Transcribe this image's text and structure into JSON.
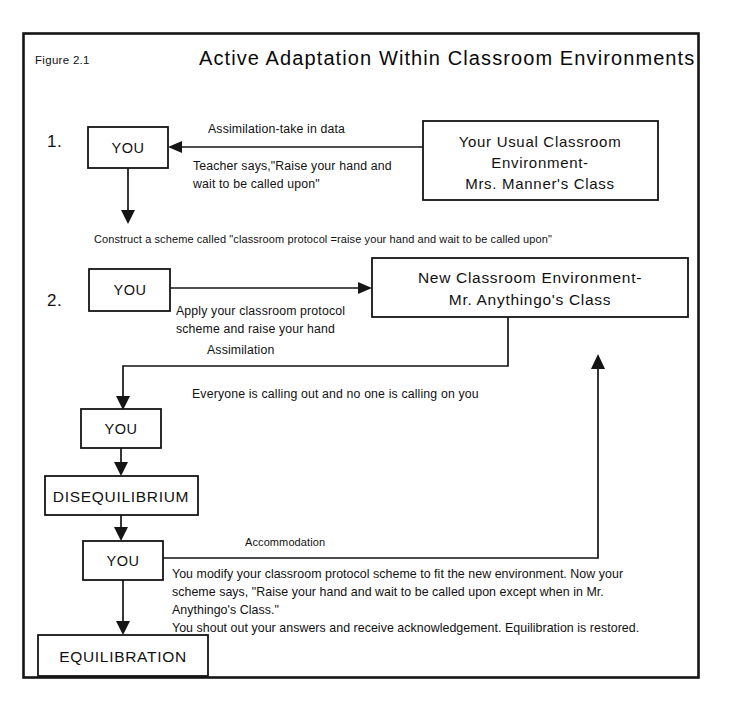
{
  "figure": {
    "label": "Figure 2.1",
    "title": "Active Adaptation Within Classroom Environments"
  },
  "steps": {
    "one": "1.",
    "two": "2."
  },
  "boxes": {
    "you_1": "YOU",
    "you_2": "YOU",
    "you_3": "YOU",
    "you_4": "YOU",
    "usual_env_line1": "Your Usual Classroom",
    "usual_env_line2": "Environment-",
    "usual_env_line3": "Mrs.  Manner's Class",
    "new_env_line1": "New Classroom Environment-",
    "new_env_line2": "Mr. Anythingo's Class",
    "disequilibrium": "DISEQUILIBRIUM",
    "equilibration": "EQUILIBRATION"
  },
  "labels": {
    "assimilation_take_in_data": "Assimilation-take in data",
    "teacher_says_line1": "Teacher says,\"Raise your hand and",
    "teacher_says_line2": "wait to be called upon\"",
    "construct_scheme": "Construct a scheme called \"classroom protocol =raise your hand and wait to be called upon\"",
    "apply_scheme_line1": "Apply your classroom protocol",
    "apply_scheme_line2": "scheme and raise your hand",
    "assimilation": "Assimilation",
    "everyone_calling_out": "Everyone is calling out and no one is calling on you",
    "accommodation": "Accommodation"
  },
  "paragraph": {
    "line1": "You modify your classroom protocol scheme to fit the new environment.  Now your",
    "line2": "scheme says, \"Raise your hand and wait to be called upon except when in Mr.",
    "line3": "Anythingo's Class.\"",
    "line4": "You shout out your answers and receive acknowledgement.  Equilibration is restored."
  },
  "colors": {
    "ink": "#151515",
    "paper": "#ffffff"
  }
}
